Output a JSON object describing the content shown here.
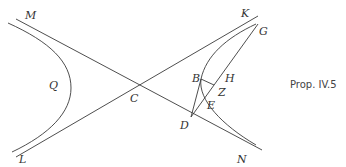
{
  "figure": {
    "caption": "Prop. IV.5",
    "points": {
      "M": "M",
      "K": "K",
      "G": "G",
      "Q": "Q",
      "C": "C",
      "B": "B",
      "H": "H",
      "Z": "Z",
      "E": "E",
      "D": "D",
      "L": "L",
      "N": "N"
    },
    "elements": {
      "asymptote_1": "MN",
      "asymptote_2": "LK",
      "left_branch": "hyperbola through Q",
      "right_branch": "hyperbola through B, E",
      "segments": [
        "GD",
        "GB",
        "BD",
        "BZ"
      ]
    }
  }
}
